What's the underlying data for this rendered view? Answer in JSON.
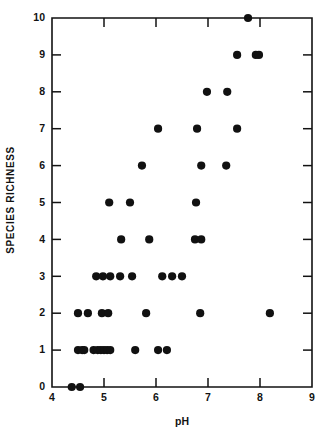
{
  "chart_data": {
    "type": "scatter",
    "title": "",
    "xlabel": "pH",
    "ylabel": "SPECIES RICHNESS",
    "xlim": [
      4,
      9
    ],
    "ylim": [
      0,
      10
    ],
    "xticks": [
      4,
      5,
      6,
      7,
      8,
      9
    ],
    "yticks": [
      0,
      1,
      2,
      3,
      4,
      5,
      6,
      7,
      8,
      9,
      10
    ],
    "xtick_labels": [
      "4",
      "5",
      "6",
      "7",
      "8",
      "9"
    ],
    "ytick_labels": [
      "0",
      "1",
      "2",
      "3",
      "4",
      "5",
      "6",
      "7",
      "8",
      "9",
      "10"
    ],
    "grid": false,
    "legend": null,
    "marker": "filled-circle",
    "marker_color": "#111111",
    "marker_size_px": 4.1,
    "points": [
      {
        "x": 4.38,
        "y": 0
      },
      {
        "x": 4.54,
        "y": 0
      },
      {
        "x": 4.5,
        "y": 1
      },
      {
        "x": 4.58,
        "y": 1
      },
      {
        "x": 4.62,
        "y": 1
      },
      {
        "x": 4.8,
        "y": 1
      },
      {
        "x": 4.88,
        "y": 1
      },
      {
        "x": 4.94,
        "y": 1
      },
      {
        "x": 5.0,
        "y": 1
      },
      {
        "x": 5.06,
        "y": 1
      },
      {
        "x": 5.12,
        "y": 1
      },
      {
        "x": 5.6,
        "y": 1
      },
      {
        "x": 6.04,
        "y": 1
      },
      {
        "x": 6.21,
        "y": 1
      },
      {
        "x": 4.5,
        "y": 2
      },
      {
        "x": 4.69,
        "y": 2
      },
      {
        "x": 4.96,
        "y": 2
      },
      {
        "x": 5.08,
        "y": 2
      },
      {
        "x": 5.81,
        "y": 2
      },
      {
        "x": 6.85,
        "y": 2
      },
      {
        "x": 8.19,
        "y": 2
      },
      {
        "x": 4.85,
        "y": 3
      },
      {
        "x": 4.98,
        "y": 3
      },
      {
        "x": 5.12,
        "y": 3
      },
      {
        "x": 5.31,
        "y": 3
      },
      {
        "x": 5.54,
        "y": 3
      },
      {
        "x": 6.12,
        "y": 3
      },
      {
        "x": 6.31,
        "y": 3
      },
      {
        "x": 6.5,
        "y": 3
      },
      {
        "x": 5.33,
        "y": 4
      },
      {
        "x": 5.87,
        "y": 4
      },
      {
        "x": 6.75,
        "y": 4
      },
      {
        "x": 6.87,
        "y": 4
      },
      {
        "x": 5.1,
        "y": 5
      },
      {
        "x": 5.5,
        "y": 5
      },
      {
        "x": 6.77,
        "y": 5
      },
      {
        "x": 5.73,
        "y": 6
      },
      {
        "x": 6.87,
        "y": 6
      },
      {
        "x": 7.35,
        "y": 6
      },
      {
        "x": 6.04,
        "y": 7
      },
      {
        "x": 6.79,
        "y": 7
      },
      {
        "x": 7.56,
        "y": 7
      },
      {
        "x": 6.98,
        "y": 8
      },
      {
        "x": 7.37,
        "y": 8
      },
      {
        "x": 7.56,
        "y": 9
      },
      {
        "x": 7.92,
        "y": 9
      },
      {
        "x": 7.98,
        "y": 9
      },
      {
        "x": 7.77,
        "y": 10
      }
    ]
  },
  "axes": {
    "x_title": "pH",
    "y_title": "SPECIES RICHNESS"
  },
  "colors": {
    "axis": "#121212",
    "marker": "#111111",
    "background": "#ffffff"
  }
}
